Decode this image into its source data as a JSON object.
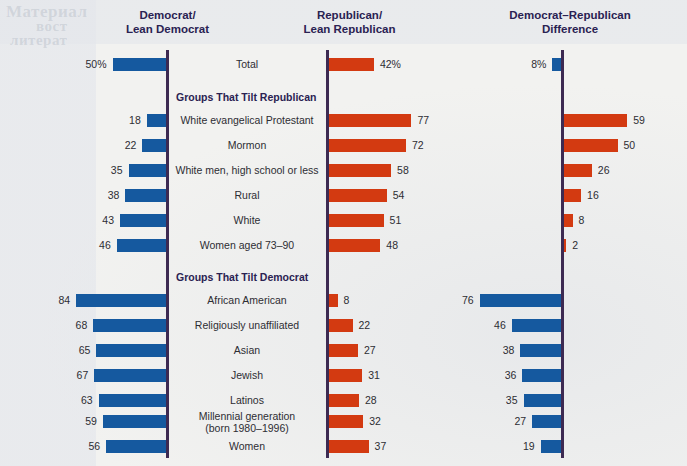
{
  "headers": {
    "col1": [
      "Democrat/",
      "Lean Democrat"
    ],
    "col2": [
      "Republican/",
      "Lean Republican"
    ],
    "col3": [
      "Democrat–Republican",
      "Difference"
    ]
  },
  "colors": {
    "democrat_blue": "#15599f",
    "republican_red": "#d33a11",
    "axis": "#3d2a52",
    "heading_text": "#2a2252",
    "background": "#f2f2f0"
  },
  "sections": [
    {
      "heading": "Groups That Tilt Republican"
    },
    {
      "heading": "Groups That Tilt Democrat"
    }
  ],
  "chart_data": {
    "type": "bar",
    "title": "",
    "subtitle": "",
    "xlabel": "",
    "ylabel": "",
    "grid": false,
    "legend_position": "top",
    "series": [
      {
        "name": "Democrat/Lean Democrat",
        "color": "#15599f",
        "direction": "left",
        "values": [
          50,
          18,
          22,
          35,
          38,
          43,
          46,
          84,
          68,
          65,
          67,
          63,
          59,
          56
        ]
      },
      {
        "name": "Republican/Lean Republican",
        "color": "#d33a11",
        "direction": "right",
        "values": [
          42,
          77,
          72,
          58,
          54,
          51,
          48,
          8,
          22,
          27,
          31,
          28,
          32,
          37
        ]
      },
      {
        "name": "Democrat–Republican Difference",
        "direction": "signed",
        "values": [
          8,
          59,
          50,
          26,
          16,
          8,
          2,
          76,
          46,
          38,
          36,
          35,
          27,
          19
        ],
        "lean": [
          "D",
          "R",
          "R",
          "R",
          "R",
          "R",
          "R",
          "D",
          "D",
          "D",
          "D",
          "D",
          "D",
          "D"
        ]
      }
    ],
    "categories": [
      "Total",
      "White evangelical Protestant",
      "Mormon",
      "White men, high school or less",
      "Rural",
      "White",
      "Women aged 73–90",
      "African American",
      "Religiously unaffiliated",
      "Asian",
      "Jewish",
      "Latinos",
      "Millennial generation (born 1980–1996)",
      "Women"
    ]
  },
  "rows": [
    {
      "label": "Total",
      "label2": "",
      "dem": "50%",
      "rep": "42%",
      "diff": "8%",
      "dem_v": 50,
      "rep_v": 42,
      "diff_v": 8,
      "diff_lean": "D",
      "y": 52
    },
    {
      "section": "Groups That Tilt Republican",
      "y": 85
    },
    {
      "label": "White evangelical Protestant",
      "label2": "",
      "dem": "18",
      "rep": "77",
      "diff": "59",
      "dem_v": 18,
      "rep_v": 77,
      "diff_v": 59,
      "diff_lean": "R",
      "y": 108
    },
    {
      "label": "Mormon",
      "label2": "",
      "dem": "22",
      "rep": "72",
      "diff": "50",
      "dem_v": 22,
      "rep_v": 72,
      "diff_v": 50,
      "diff_lean": "R",
      "y": 133
    },
    {
      "label": "White men, high school or less",
      "label2": "",
      "dem": "35",
      "rep": "58",
      "diff": "26",
      "dem_v": 35,
      "rep_v": 58,
      "diff_v": 26,
      "diff_lean": "R",
      "y": 158
    },
    {
      "label": "Rural",
      "label2": "",
      "dem": "38",
      "rep": "54",
      "diff": "16",
      "dem_v": 38,
      "rep_v": 54,
      "diff_v": 16,
      "diff_lean": "R",
      "y": 183
    },
    {
      "label": "White",
      "label2": "",
      "dem": "43",
      "rep": "51",
      "diff": "8",
      "dem_v": 43,
      "rep_v": 51,
      "diff_v": 8,
      "diff_lean": "R",
      "y": 208
    },
    {
      "label": "Women aged 73–90",
      "label2": "",
      "dem": "46",
      "rep": "48",
      "diff": "2",
      "dem_v": 46,
      "rep_v": 48,
      "diff_v": 2,
      "diff_lean": "R",
      "y": 233
    },
    {
      "section": "Groups That Tilt Democrat",
      "y": 265
    },
    {
      "label": "African American",
      "label2": "",
      "dem": "84",
      "rep": "8",
      "diff": "76",
      "dem_v": 84,
      "rep_v": 8,
      "diff_v": 76,
      "diff_lean": "D",
      "y": 288
    },
    {
      "label": "Religiously unaffiliated",
      "label2": "",
      "dem": "68",
      "rep": "22",
      "diff": "46",
      "dem_v": 68,
      "rep_v": 22,
      "diff_v": 46,
      "diff_lean": "D",
      "y": 313
    },
    {
      "label": "Asian",
      "label2": "",
      "dem": "65",
      "rep": "27",
      "diff": "38",
      "dem_v": 65,
      "rep_v": 27,
      "diff_v": 38,
      "diff_lean": "D",
      "y": 338
    },
    {
      "label": "Jewish",
      "label2": "",
      "dem": "67",
      "rep": "31",
      "diff": "36",
      "dem_v": 67,
      "rep_v": 31,
      "diff_v": 36,
      "diff_lean": "D",
      "y": 363
    },
    {
      "label": "Latinos",
      "label2": "",
      "dem": "63",
      "rep": "28",
      "diff": "35",
      "dem_v": 63,
      "rep_v": 28,
      "diff_v": 35,
      "diff_lean": "D",
      "y": 388
    },
    {
      "label": "Millennial generation",
      "label2": "(born 1980–1996)",
      "dem": "59",
      "rep": "32",
      "diff": "27",
      "dem_v": 59,
      "rep_v": 32,
      "diff_v": 27,
      "diff_lean": "D",
      "y": 409
    },
    {
      "label": "Women",
      "label2": "",
      "dem": "56",
      "rep": "37",
      "diff": "19",
      "dem_v": 56,
      "rep_v": 37,
      "diff_v": 19,
      "diff_lean": "D",
      "y": 434
    }
  ],
  "ghost_text": [
    {
      "t": "Материал",
      "x": 6,
      "y": 2,
      "size": 17
    },
    {
      "t": "вост",
      "x": 36,
      "y": 18,
      "size": 15
    },
    {
      "t": "литерат",
      "x": 10,
      "y": 32,
      "size": 15
    }
  ]
}
